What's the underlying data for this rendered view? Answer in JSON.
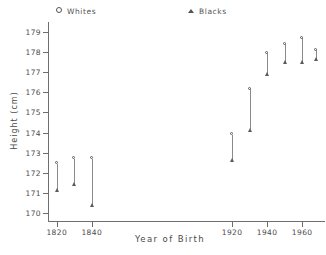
{
  "chart_data": {
    "type": "scatter",
    "title": "",
    "xlabel": "Year of Birth",
    "ylabel": "Height (cm)",
    "xlim": [
      1815,
      1973
    ],
    "ylim": [
      169.6,
      179.4
    ],
    "grid": false,
    "legend_position": "top",
    "x": [
      1820,
      1830,
      1840,
      1920,
      1930,
      1940,
      1950,
      1960,
      1968
    ],
    "series": [
      {
        "name": "Whites",
        "marker": "open-circle",
        "values": [
          172.45,
          172.7,
          172.7,
          173.9,
          176.15,
          177.95,
          178.4,
          178.7,
          178.1
        ]
      },
      {
        "name": "Blacks",
        "marker": "filled-triangle",
        "values": [
          171.15,
          171.45,
          170.4,
          172.65,
          174.15,
          176.9,
          177.5,
          177.5,
          177.65
        ]
      }
    ],
    "x_ticks": [
      1820,
      1840,
      1920,
      1940,
      1960
    ],
    "x_tick_labels": [
      "1820",
      "1840",
      "1920",
      "1940",
      "1960"
    ],
    "y_ticks": [
      170,
      171,
      172,
      173,
      174,
      175,
      176,
      177,
      178,
      179
    ],
    "y_tick_labels": [
      "170",
      "171",
      "172",
      "173",
      "174",
      "175",
      "176",
      "177",
      "178",
      "179"
    ],
    "colors": {
      "axis": "#6e6e6e",
      "marker": "#5a5a5a",
      "connector": "#8a8a8a",
      "text": "#4a4a4a",
      "background": "#ffffff"
    }
  },
  "legend": {
    "whites": "Whites",
    "blacks": "Blacks"
  }
}
